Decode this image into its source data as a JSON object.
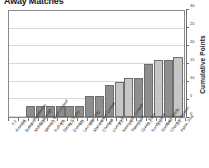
{
  "chart_title": "Away Matches",
  "axis": {
    "y_title": "Cumulative Points",
    "y_ticks": [
      "0",
      "5",
      "10",
      "15",
      "20",
      "25",
      "30"
    ]
  },
  "colors": {
    "bar_dark": "#8e8e8e",
    "bar_light": "#c6c6c6",
    "bar_border": "#6e6e6e",
    "gridline": "#d8d8d8",
    "axis": "#6e6e6e",
    "text": "#2b2b2b",
    "background": "#ffffff"
  },
  "chart_data": {
    "type": "bar",
    "title": "Away Matches",
    "xlabel": "",
    "ylabel": "Cumulative Points",
    "ylim": [
      0,
      30
    ],
    "yticks": [
      0,
      5,
      10,
      15,
      20,
      25,
      30
    ],
    "grid": true,
    "legend": "none",
    "categories": [
      "Arsenal",
      "Bolton Wanderers",
      "Middlesbrough",
      "Ipswich Town United",
      "Fulham",
      "Derby County",
      "Everton",
      "Leicester City",
      "Manchester United",
      "Chelsea",
      "Liverpool",
      "Newcastle United",
      "Tottenham",
      "Green Town",
      "Sunderland",
      "Sheffield Weds",
      "Charlton Athletic",
      "Aston Villa"
    ],
    "results": [
      "0-2",
      "0-3",
      "1-0",
      "0-1",
      "0-2",
      "1-0",
      "0-1",
      "0-2",
      "4-0",
      "1-0",
      "3-0",
      "1-1",
      "1-1",
      "1-0",
      "3-1",
      "1-1",
      "0-0",
      "1-1"
    ],
    "values": [
      0,
      0,
      3,
      3,
      3,
      3,
      3,
      3,
      6,
      6,
      9,
      10,
      11,
      11,
      15,
      16,
      16,
      17
    ],
    "series": [
      {
        "name": "Cumulative Points",
        "values": [
          0,
          0,
          3,
          3,
          3,
          3,
          3,
          3,
          6,
          6,
          9,
          10,
          11,
          11,
          15,
          16,
          16,
          17
        ]
      }
    ],
    "shades": [
      "dark",
      "dark",
      "dark",
      "dark",
      "dark",
      "dark",
      "dark",
      "dark",
      "dark",
      "dark",
      "dark",
      "light",
      "light",
      "dark",
      "dark",
      "light",
      "dark",
      "light"
    ]
  }
}
